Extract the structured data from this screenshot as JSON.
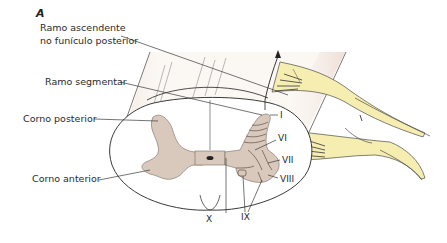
{
  "figure": {
    "panel_label": "A",
    "labels": {
      "ramo_ascendente_line1": "Ramo ascendente",
      "ramo_ascendente_line2": "no funículo posterior",
      "ramo_segmentar": "Ramo segmentar",
      "corno_posterior": "Corno posterior",
      "corno_anterior": "Corno anterior"
    },
    "laminae": {
      "i": "I",
      "vi": "VI",
      "vii": "VII",
      "viii": "VIII",
      "ix": "IX",
      "x": "X"
    },
    "colors": {
      "gray_matter": "#d9c9bd",
      "root_fibers": "#f6eeb0",
      "outline": "#3a3a3a",
      "column_shade": "#efe3da"
    }
  }
}
